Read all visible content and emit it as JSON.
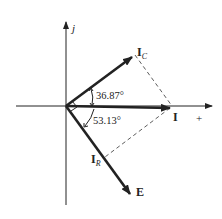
{
  "diagram": {
    "type": "phasor-diagram",
    "axes": {
      "vertical_label": "j",
      "horizontal_label": "+"
    },
    "phasors": [
      {
        "id": "I_C",
        "label_main": "I",
        "label_sub": "C",
        "angle_deg": 36.87
      },
      {
        "id": "I",
        "label_main": "I",
        "label_sub": "",
        "angle_deg": 0
      },
      {
        "id": "E",
        "label_main": "E",
        "label_sub": "",
        "angle_deg": -53.13
      },
      {
        "id": "I_R",
        "label_main": "I",
        "label_sub": "R",
        "angle_deg": -53.13
      }
    ],
    "angles": {
      "upper": "36.87°",
      "lower": "53.13°"
    },
    "colors": {
      "ink": "#222222",
      "background": "#ffffff"
    }
  }
}
